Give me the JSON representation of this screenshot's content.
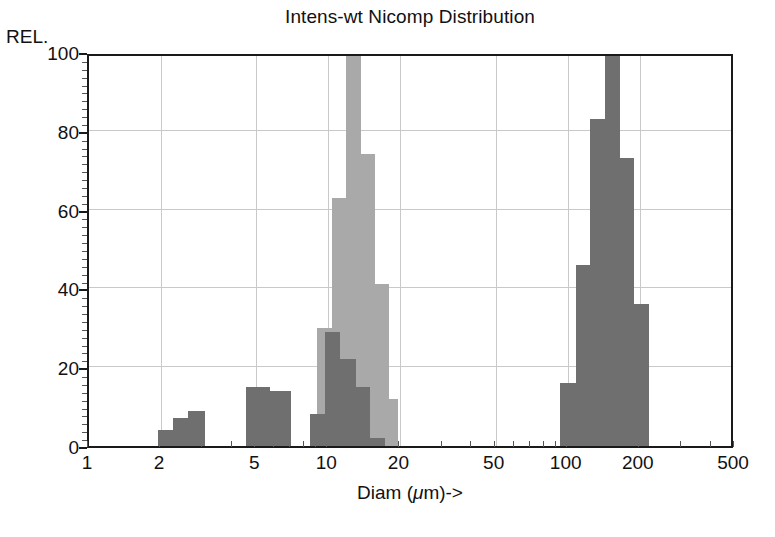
{
  "chart_data": {
    "type": "bar",
    "title": "Intens-wt Nicomp Distribution",
    "xlabel": "Diam (μm)->",
    "ylabel": "REL.",
    "ylim": [
      0,
      100
    ],
    "xlim": [
      1,
      500
    ],
    "xscale": "log",
    "grid": true,
    "legend": "none",
    "ytick_labels": [
      "0",
      "20",
      "40",
      "60",
      "80",
      "100"
    ],
    "ytick_values": [
      0,
      20,
      40,
      60,
      80,
      100
    ],
    "xtick_labels": [
      "1",
      "2",
      "5",
      "10",
      "20",
      "50",
      "100",
      "200",
      "500"
    ],
    "xtick_values": [
      1,
      2,
      5,
      10,
      20,
      50,
      100,
      200,
      500
    ],
    "colors": {
      "series_light": "#a9a9a9",
      "series_dark": "#6f6f6f",
      "axis": "#1a1a1a",
      "grid": "#c9c9c9",
      "background": "#ffffff"
    },
    "series": [
      {
        "name": "light-distribution",
        "color": "#a9a9a9",
        "bars": [
          {
            "x_start": 9.0,
            "x_end": 10.4,
            "value": 30
          },
          {
            "x_start": 10.4,
            "x_end": 11.9,
            "value": 63
          },
          {
            "x_start": 11.9,
            "x_end": 13.7,
            "value": 100
          },
          {
            "x_start": 13.7,
            "x_end": 15.7,
            "value": 74
          },
          {
            "x_start": 15.7,
            "x_end": 18.0,
            "value": 41
          },
          {
            "x_start": 18.0,
            "x_end": 19.6,
            "value": 12
          }
        ]
      },
      {
        "name": "dark-distribution",
        "color": "#6f6f6f",
        "bars": [
          {
            "x_start": 1.95,
            "x_end": 2.25,
            "value": 4
          },
          {
            "x_start": 2.25,
            "x_end": 2.6,
            "value": 7
          },
          {
            "x_start": 2.6,
            "x_end": 3.05,
            "value": 9
          },
          {
            "x_start": 4.55,
            "x_end": 5.7,
            "value": 15
          },
          {
            "x_start": 5.7,
            "x_end": 7.0,
            "value": 14
          },
          {
            "x_start": 8.35,
            "x_end": 9.7,
            "value": 8
          },
          {
            "x_start": 9.7,
            "x_end": 11.2,
            "value": 29
          },
          {
            "x_start": 11.2,
            "x_end": 13.0,
            "value": 22
          },
          {
            "x_start": 13.0,
            "x_end": 15.0,
            "value": 15
          },
          {
            "x_start": 15.0,
            "x_end": 17.3,
            "value": 2
          },
          {
            "x_start": 93.0,
            "x_end": 108.0,
            "value": 16
          },
          {
            "x_start": 108.0,
            "x_end": 124.0,
            "value": 46
          },
          {
            "x_start": 124.0,
            "x_end": 143.0,
            "value": 83
          },
          {
            "x_start": 143.0,
            "x_end": 165.0,
            "value": 100
          },
          {
            "x_start": 165.0,
            "x_end": 190.0,
            "value": 73
          },
          {
            "x_start": 190.0,
            "x_end": 219.0,
            "value": 36
          }
        ]
      }
    ]
  }
}
